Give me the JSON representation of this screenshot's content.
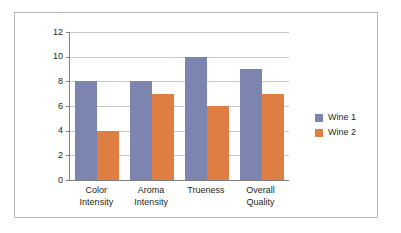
{
  "chart_data": {
    "type": "bar",
    "title": "",
    "subtitle": "",
    "xlabel": "",
    "ylabel": "",
    "categories": [
      "Color\nIntensity",
      "Aroma\nIntensity",
      "Trueness",
      "Overall\nQuality"
    ],
    "series": [
      {
        "name": "Wine 1",
        "color": "#7b85b0",
        "values": [
          8,
          8,
          10,
          9
        ]
      },
      {
        "name": "Wine 2",
        "color": "#de7e43",
        "values": [
          4,
          7,
          6,
          7
        ]
      }
    ],
    "ylim": [
      0,
      12
    ],
    "ytick_labels": [
      "12",
      "10",
      "8",
      "6",
      "4",
      "2",
      "0"
    ],
    "ytick_values": [
      12,
      10,
      8,
      6,
      4,
      2,
      0
    ],
    "ytick_step": 2,
    "grid": true,
    "grid_axis": "y",
    "legend_position": "right",
    "legend": [
      "Wine 1",
      "Wine 2"
    ],
    "annotations": []
  },
  "style": {
    "accent_series_1": "#7b85b0",
    "accent_series_2": "#de7e43",
    "grid_color": "#c8c8c8",
    "axis_color": "#808080",
    "frame_border_color": "#b9b9b9",
    "text_color": "#231f20",
    "background": "#ffffff"
  }
}
